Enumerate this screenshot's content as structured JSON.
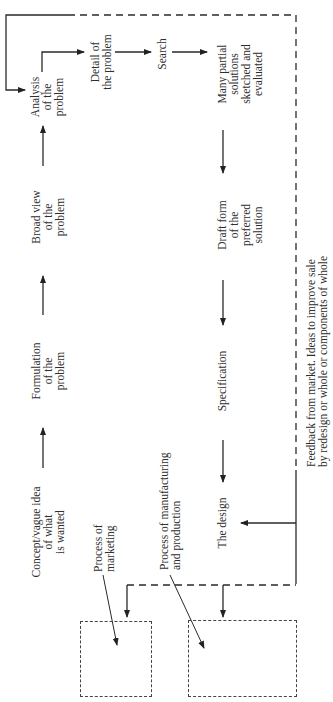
{
  "diagram": {
    "type": "flowchart",
    "orientation": "rotated-90-ccw",
    "nodes": {
      "concept": "Concept/vague idea\nof what\nis wanted",
      "formulation": "Formulation\nof the\nproblem",
      "broad_view": "Broad view\nof the\nproblem",
      "analysis": "Analysis\nof the\nproblem",
      "detail": "Detail of\nthe problem",
      "search": "Search",
      "partial_solutions": "Many partial\nsolutions\nsketched and\nevaluated",
      "draft_form": "Draft form\nof the\npreferred\nsolution",
      "specification": "Specification",
      "the_design": "The design",
      "marketing": "Process of\nmarketing",
      "manufacturing": "Process of manufacturing\nand production",
      "feedback": "Feedback from market. Ideas to improve sale\nby redesign or whole or components of whole"
    },
    "edges": [
      {
        "from": "concept",
        "to": "formulation"
      },
      {
        "from": "formulation",
        "to": "broad_view"
      },
      {
        "from": "broad_view",
        "to": "analysis"
      },
      {
        "from": "analysis",
        "to": "detail"
      },
      {
        "from": "detail",
        "to": "search"
      },
      {
        "from": "search",
        "to": "partial_solutions"
      },
      {
        "from": "partial_solutions",
        "to": "draft_form"
      },
      {
        "from": "draft_form",
        "to": "specification"
      },
      {
        "from": "specification",
        "to": "the_design"
      },
      {
        "from": "the_design",
        "to": "marketing",
        "style": "dashed"
      },
      {
        "from": "the_design",
        "to": "manufacturing",
        "style": "dashed"
      },
      {
        "from": "feedback",
        "to": "analysis",
        "style": "dashed"
      },
      {
        "from": "feedback",
        "to": "the_design"
      }
    ]
  }
}
